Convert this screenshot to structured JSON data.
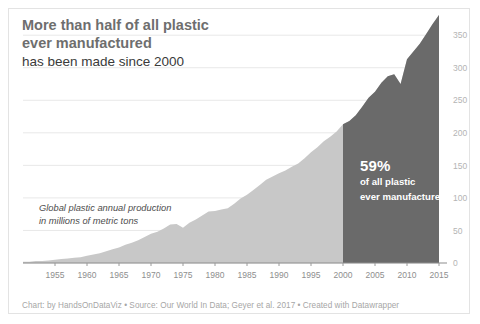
{
  "title": {
    "line1": "More than half of all plastic",
    "line2": "ever manufactured",
    "line3": "has been made since 2000"
  },
  "axis_note": {
    "line1": "Global plastic annual production",
    "line2": "in millions of metric tons"
  },
  "annotation": {
    "percent": "59%",
    "line1": "of all plastic",
    "line2": "ever manufactured"
  },
  "footer": {
    "text": "Chart: by HandsOnDataViz • Source: Our World In Data; Geyer et al. 2017 • Created with Datawrapper"
  },
  "colors": {
    "area_light": "#c8c8c8",
    "area_dark": "#6a6a6a",
    "title_bold": "#6e6e6e",
    "title_regular": "#3a3a3a",
    "ytick": "#b4b4b4",
    "xtick": "#8e8e8e",
    "grid": "#e8e8e8",
    "border": "#e3e3e3",
    "annotation_text": "#ffffff",
    "footer": "#a6a6a6"
  },
  "chart_data": {
    "type": "area",
    "title": "More than half of all plastic ever manufactured has been made since 2000",
    "xlabel": "",
    "ylabel": "Global plastic annual production in millions of metric tons",
    "xlim": [
      1950,
      2015
    ],
    "ylim": [
      0,
      381
    ],
    "yticks": [
      0,
      50,
      100,
      150,
      200,
      250,
      300,
      350
    ],
    "ytick_labels": [
      "0",
      "50",
      "100",
      "150",
      "200",
      "250",
      "300",
      "350"
    ],
    "ytick_position": "right",
    "xticks": [
      1955,
      1960,
      1965,
      1970,
      1975,
      1980,
      1985,
      1990,
      1995,
      2000,
      2005,
      2010,
      2015
    ],
    "xtick_labels": [
      "1955",
      "1960",
      "1965",
      "1970",
      "1975",
      "1980",
      "1985",
      "1990",
      "1995",
      "2000",
      "2005",
      "2010",
      "2015"
    ],
    "grid": false,
    "legend": false,
    "highlight": {
      "from_year": 2000,
      "to_year": 2015,
      "label": "59% of all plastic ever manufactured",
      "color": "#6a6a6a"
    },
    "x": [
      1950,
      1951,
      1952,
      1953,
      1954,
      1955,
      1956,
      1957,
      1958,
      1959,
      1960,
      1961,
      1962,
      1963,
      1964,
      1965,
      1966,
      1967,
      1968,
      1969,
      1970,
      1971,
      1972,
      1973,
      1974,
      1975,
      1976,
      1977,
      1978,
      1979,
      1980,
      1981,
      1982,
      1983,
      1984,
      1985,
      1986,
      1987,
      1988,
      1989,
      1990,
      1991,
      1992,
      1993,
      1994,
      1995,
      1996,
      1997,
      1998,
      1999,
      2000,
      2001,
      2002,
      2003,
      2004,
      2005,
      2006,
      2007,
      2008,
      2009,
      2010,
      2011,
      2012,
      2013,
      2014,
      2015
    ],
    "values": [
      2,
      2,
      3,
      3,
      4,
      5,
      6,
      7,
      8,
      9,
      11,
      13,
      15,
      18,
      21,
      24,
      28,
      31,
      35,
      40,
      45,
      48,
      53,
      59,
      60,
      54,
      62,
      67,
      73,
      79,
      80,
      82,
      84,
      91,
      99,
      105,
      112,
      120,
      128,
      133,
      138,
      142,
      148,
      153,
      161,
      170,
      178,
      187,
      194,
      202,
      213,
      218,
      227,
      240,
      254,
      263,
      277,
      287,
      290,
      275,
      313,
      325,
      337,
      352,
      367,
      381
    ],
    "series_name": "Global plastic annual production (million metric tons)",
    "annotations": [
      {
        "text": "59% of all plastic ever manufactured",
        "x_range": [
          2000,
          2015
        ]
      },
      {
        "text": "Global plastic annual production in millions of metric tons",
        "x": 1957,
        "y": 120
      }
    ]
  }
}
